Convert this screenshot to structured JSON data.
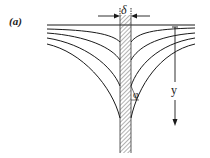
{
  "figure": {
    "panel_label": "(a)",
    "labels": {
      "wall_thickness": "δ",
      "angle": "φ",
      "depth_axis": "y"
    },
    "colors": {
      "line": "#1a1a1a",
      "background": "#ffffff",
      "hatch": "#555555"
    },
    "elements": {
      "surface_line": "horizontal free surface",
      "wall": "hatched vertical wall",
      "curves_per_side": 4,
      "depth_arrow": "downward arrow"
    }
  }
}
